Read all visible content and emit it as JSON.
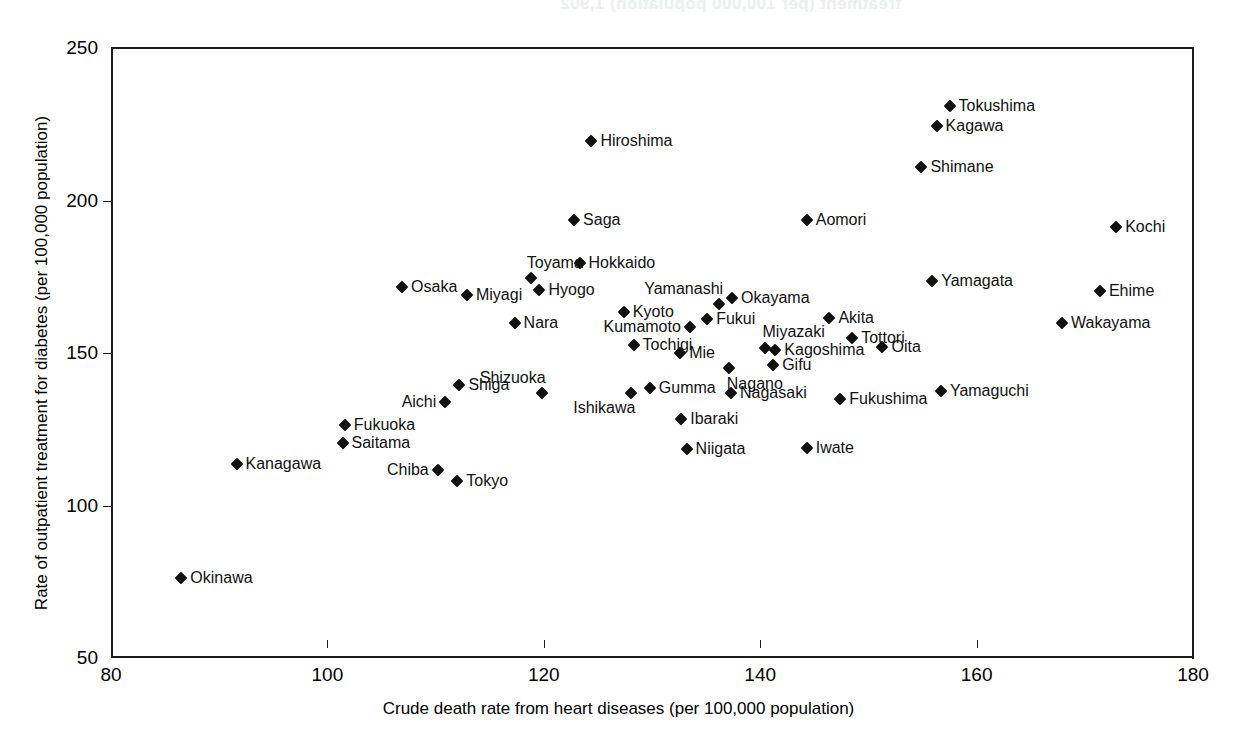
{
  "ghost_text": {
    "line1": "treatment (per 100,000 population) 1,902",
    "line2": "1,902"
  },
  "axes": {
    "x_title": "Crude death rate from heart diseases (per 100,000 population)",
    "y_title": "Rate of outpatient treatment for diabetes (per 100,000 population)",
    "x_ticks": [
      80,
      100,
      120,
      140,
      160,
      180
    ],
    "y_ticks": [
      50,
      100,
      150,
      200,
      250
    ]
  },
  "chart_data": {
    "type": "scatter",
    "title": "",
    "xlabel": "Crude death rate from heart diseases (per 100,000 population)",
    "ylabel": "Rate of outpatient treatment for diabetes (per 100,000 population)",
    "xlim": [
      80,
      180
    ],
    "ylim": [
      50,
      250
    ],
    "grid": false,
    "legend": "none",
    "marker": "diamond",
    "marker_color": "#111111",
    "points": [
      {
        "label": "Tokushima",
        "x": 157.5,
        "y": 231.0,
        "pos": "right"
      },
      {
        "label": "Kagawa",
        "x": 156.3,
        "y": 224.3,
        "pos": "right"
      },
      {
        "label": "Hiroshima",
        "x": 124.4,
        "y": 219.5,
        "pos": "right"
      },
      {
        "label": "Shimane",
        "x": 154.9,
        "y": 211.0,
        "pos": "right"
      },
      {
        "label": "Saga",
        "x": 122.8,
        "y": 193.5,
        "pos": "right"
      },
      {
        "label": "Aomori",
        "x": 144.3,
        "y": 193.5,
        "pos": "right"
      },
      {
        "label": "Kochi",
        "x": 172.9,
        "y": 191.2,
        "pos": "right"
      },
      {
        "label": "Hokkaido",
        "x": 123.3,
        "y": 179.5,
        "pos": "right"
      },
      {
        "label": "Toyama",
        "x": 118.8,
        "y": 174.5,
        "pos": "above-right"
      },
      {
        "label": "Yamagata",
        "x": 155.9,
        "y": 173.5,
        "pos": "right"
      },
      {
        "label": "Osaka",
        "x": 106.9,
        "y": 171.5,
        "pos": "right"
      },
      {
        "label": "Ehime",
        "x": 171.4,
        "y": 170.2,
        "pos": "right"
      },
      {
        "label": "Hyogo",
        "x": 119.6,
        "y": 170.5,
        "pos": "right"
      },
      {
        "label": "Miyagi",
        "x": 112.9,
        "y": 169.0,
        "pos": "right"
      },
      {
        "label": "Okayama",
        "x": 137.4,
        "y": 168.0,
        "pos": "right"
      },
      {
        "label": "Yamanashi",
        "x": 136.2,
        "y": 166.0,
        "pos": "above-left"
      },
      {
        "label": "Kyoto",
        "x": 127.4,
        "y": 163.5,
        "pos": "right"
      },
      {
        "label": "Akita",
        "x": 146.4,
        "y": 161.5,
        "pos": "right"
      },
      {
        "label": "Fukui",
        "x": 135.1,
        "y": 161.0,
        "pos": "right"
      },
      {
        "label": "Nara",
        "x": 117.3,
        "y": 160.0,
        "pos": "right"
      },
      {
        "label": "Wakayama",
        "x": 167.9,
        "y": 159.8,
        "pos": "right"
      },
      {
        "label": "Kumamoto",
        "x": 133.5,
        "y": 158.5,
        "pos": "left"
      },
      {
        "label": "Tottori",
        "x": 148.5,
        "y": 155.0,
        "pos": "right"
      },
      {
        "label": "Tochigi",
        "x": 128.3,
        "y": 152.5,
        "pos": "right"
      },
      {
        "label": "Oita",
        "x": 151.3,
        "y": 152.0,
        "pos": "right"
      },
      {
        "label": "Miyazaki",
        "x": 140.4,
        "y": 151.5,
        "pos": "above"
      },
      {
        "label": "Kagoshima",
        "x": 141.4,
        "y": 151.0,
        "pos": "right"
      },
      {
        "label": "Mie",
        "x": 132.6,
        "y": 150.0,
        "pos": "right"
      },
      {
        "label": "Gifu",
        "x": 141.2,
        "y": 146.0,
        "pos": "right"
      },
      {
        "label": "Nagano",
        "x": 137.1,
        "y": 145.0,
        "pos": "below"
      },
      {
        "label": "Shiga",
        "x": 112.2,
        "y": 139.5,
        "pos": "right"
      },
      {
        "label": "Gumma",
        "x": 129.8,
        "y": 138.5,
        "pos": "right"
      },
      {
        "label": "Yamaguchi",
        "x": 156.7,
        "y": 137.5,
        "pos": "right"
      },
      {
        "label": "Shizuoka",
        "x": 119.8,
        "y": 137.0,
        "pos": "above-left"
      },
      {
        "label": "Nagasaki",
        "x": 137.3,
        "y": 137.0,
        "pos": "right"
      },
      {
        "label": "Ishikawa",
        "x": 128.1,
        "y": 136.8,
        "pos": "below-left"
      },
      {
        "label": "Fukushima",
        "x": 147.4,
        "y": 135.0,
        "pos": "right"
      },
      {
        "label": "Aichi",
        "x": 110.9,
        "y": 134.0,
        "pos": "left"
      },
      {
        "label": "Ibaraki",
        "x": 132.7,
        "y": 128.5,
        "pos": "right"
      },
      {
        "label": "Fukuoka",
        "x": 101.6,
        "y": 126.5,
        "pos": "right"
      },
      {
        "label": "Saitama",
        "x": 101.4,
        "y": 120.5,
        "pos": "right"
      },
      {
        "label": "Niigata",
        "x": 133.2,
        "y": 118.5,
        "pos": "right"
      },
      {
        "label": "Iwate",
        "x": 144.3,
        "y": 119.0,
        "pos": "right"
      },
      {
        "label": "Kanagawa",
        "x": 91.6,
        "y": 113.5,
        "pos": "right"
      },
      {
        "label": "Chiba",
        "x": 110.2,
        "y": 111.8,
        "pos": "left"
      },
      {
        "label": "Tokyo",
        "x": 112.0,
        "y": 108.0,
        "pos": "right"
      },
      {
        "label": "Okinawa",
        "x": 86.5,
        "y": 76.2,
        "pos": "right"
      }
    ]
  }
}
